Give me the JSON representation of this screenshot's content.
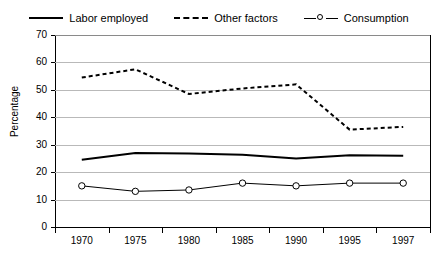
{
  "legend": {
    "position": "top-center",
    "entries": [
      {
        "label": "Labor employed",
        "style": "solid",
        "marker": "none"
      },
      {
        "label": "Other factors",
        "style": "dashed",
        "marker": "none"
      },
      {
        "label": "Consumption",
        "style": "solid-thin",
        "marker": "open-circle"
      }
    ]
  },
  "axes": {
    "ylabel": "Percentage",
    "xlabel": "",
    "yticks": [
      0,
      10,
      20,
      30,
      40,
      50,
      60,
      70
    ],
    "xticks": [
      "1970",
      "1975",
      "1980",
      "1985",
      "1990",
      "1995",
      "1997"
    ]
  },
  "chart_data": {
    "type": "line",
    "title": "",
    "subtitle": "",
    "xlabel": "",
    "ylabel": "Percentage",
    "categories": [
      "1970",
      "1975",
      "1980",
      "1985",
      "1990",
      "1995",
      "1997"
    ],
    "ylim": [
      0,
      70
    ],
    "ytick_step": 10,
    "grid": "horizontal",
    "legend_position": "top-center",
    "series": [
      {
        "name": "Labor employed",
        "style": "solid",
        "color": "#000000",
        "marker": "none",
        "values": [
          24.5,
          27.0,
          26.8,
          26.3,
          25.0,
          26.2,
          26.0
        ]
      },
      {
        "name": "Other factors",
        "style": "dashed",
        "color": "#000000",
        "marker": "none",
        "values": [
          54.5,
          57.5,
          48.5,
          50.5,
          52.0,
          35.5,
          36.5
        ]
      },
      {
        "name": "Consumption",
        "style": "solid",
        "color": "#000000",
        "marker": "open-circle",
        "values": [
          15.0,
          13.0,
          13.5,
          16.0,
          15.0,
          16.0,
          16.0
        ]
      }
    ]
  }
}
